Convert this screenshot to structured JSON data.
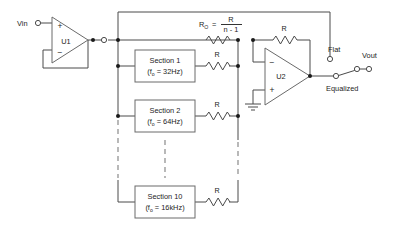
{
  "diagram": {
    "colors": {
      "wire": "#4a4a4a",
      "dashed_wire": "#8a8a8a",
      "box_stroke": "#6a6a6a",
      "node": "#1a1a1a",
      "text": "#1d1d1d",
      "background": "#ffffff"
    }
  },
  "terminals": {
    "input_label": "Vin",
    "output_label": "Vout"
  },
  "opamps": [
    {
      "ref": "U1",
      "plus": "+",
      "minus": "−",
      "role": "input-buffer"
    },
    {
      "ref": "U2",
      "plus": "+",
      "minus": "−",
      "role": "summing-amplifier"
    }
  ],
  "sections": [
    {
      "name": "Section 1",
      "freq_prefix": "(f",
      "freq_sub": "o",
      "freq_value": " = 32Hz)"
    },
    {
      "name": "Section 2",
      "freq_prefix": "(f",
      "freq_sub": "o",
      "freq_value": " = 64Hz)"
    },
    {
      "name": "Section 10",
      "freq_prefix": "(f",
      "freq_sub": "o",
      "freq_value": " = 16kHz)"
    }
  ],
  "resistors": {
    "feedback_label": "R",
    "section_label": "R",
    "r0": {
      "symbol": "R",
      "subscript": "O",
      "equals": "=",
      "numerator": "R",
      "denominator": "n - 1"
    }
  },
  "switch": {
    "name": "output-mode-switch",
    "position_flat_label": "Flat",
    "position_equalized_label": "Equalized",
    "selected": "Equalized"
  },
  "ground": {
    "label": ""
  }
}
